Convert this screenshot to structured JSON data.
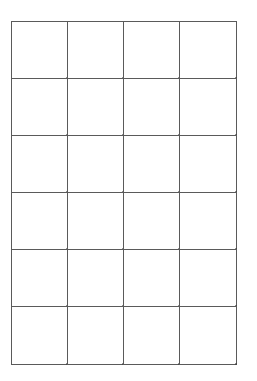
{
  "page": {
    "background_color": "#ffffff",
    "width": 257,
    "height": 381
  },
  "grid": {
    "name": "blank-grid",
    "columns": 4,
    "rows": 6,
    "cell_count": 24,
    "line_color": "#5a5a5a",
    "cell_fill": "#ffffff",
    "left": 11,
    "top": 21,
    "width": 225,
    "height": 343,
    "column_pitch": 56,
    "row_pitch": 57,
    "cells": [
      {
        "id": "r1c1",
        "label": ""
      },
      {
        "id": "r1c2",
        "label": ""
      },
      {
        "id": "r1c3",
        "label": ""
      },
      {
        "id": "r1c4",
        "label": ""
      },
      {
        "id": "r2c1",
        "label": ""
      },
      {
        "id": "r2c2",
        "label": ""
      },
      {
        "id": "r2c3",
        "label": ""
      },
      {
        "id": "r2c4",
        "label": ""
      },
      {
        "id": "r3c1",
        "label": ""
      },
      {
        "id": "r3c2",
        "label": ""
      },
      {
        "id": "r3c3",
        "label": ""
      },
      {
        "id": "r3c4",
        "label": ""
      },
      {
        "id": "r4c1",
        "label": ""
      },
      {
        "id": "r4c2",
        "label": ""
      },
      {
        "id": "r4c3",
        "label": ""
      },
      {
        "id": "r4c4",
        "label": ""
      },
      {
        "id": "r5c1",
        "label": ""
      },
      {
        "id": "r5c2",
        "label": ""
      },
      {
        "id": "r5c3",
        "label": ""
      },
      {
        "id": "r5c4",
        "label": ""
      },
      {
        "id": "r6c1",
        "label": ""
      },
      {
        "id": "r6c2",
        "label": ""
      },
      {
        "id": "r6c3",
        "label": ""
      },
      {
        "id": "r6c4",
        "label": ""
      }
    ]
  }
}
